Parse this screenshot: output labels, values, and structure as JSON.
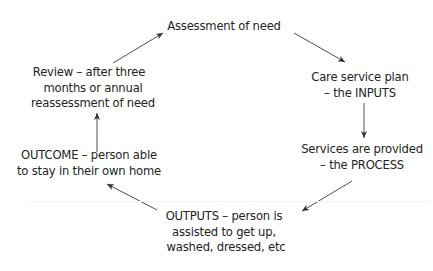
{
  "diagram": {
    "title": "",
    "type": "cycle",
    "nodes": [
      {
        "id": "assessment",
        "lines": [
          "Assessment of need"
        ]
      },
      {
        "id": "care-plan",
        "lines": [
          "Care service plan",
          "– the INPUTS"
        ]
      },
      {
        "id": "services",
        "lines": [
          "Services are provided",
          "– the PROCESS"
        ]
      },
      {
        "id": "outputs",
        "lines": [
          "OUTPUTS – person is",
          "assisted to get up,",
          "washed, dressed, etc"
        ]
      },
      {
        "id": "outcome",
        "lines": [
          "OUTCOME – person able",
          "to stay in their own home"
        ]
      },
      {
        "id": "review",
        "lines": [
          "Review – after three",
          "months or annual",
          "reassessment of need"
        ]
      }
    ],
    "edges": [
      {
        "from": "assessment",
        "to": "care-plan"
      },
      {
        "from": "care-plan",
        "to": "services"
      },
      {
        "from": "services",
        "to": "outputs"
      },
      {
        "from": "outputs",
        "to": "outcome"
      },
      {
        "from": "outcome",
        "to": "review"
      },
      {
        "from": "review",
        "to": "assessment"
      }
    ],
    "colors": {
      "text": "#232323",
      "arrow": "#3a3a3a",
      "background": "#ffffff"
    }
  }
}
